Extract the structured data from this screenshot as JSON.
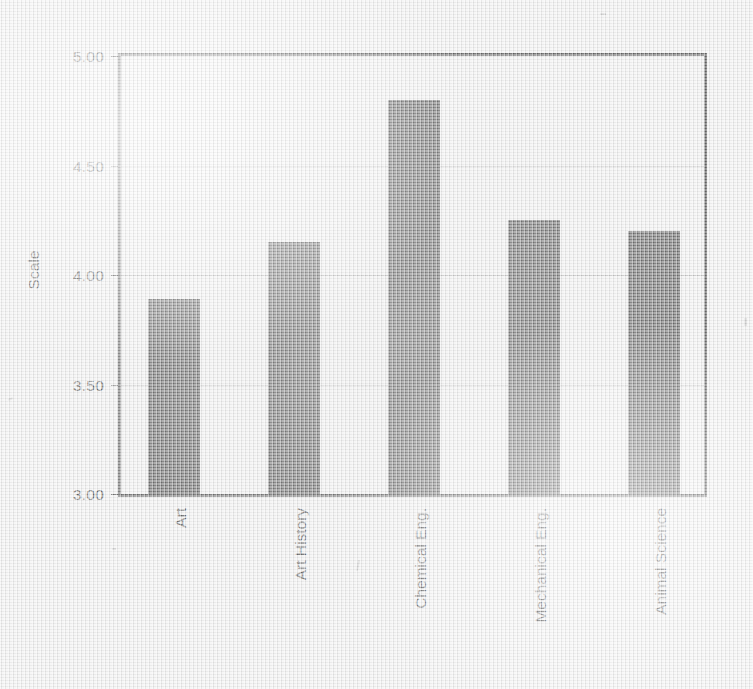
{
  "chart_data": {
    "type": "bar",
    "title": "",
    "subtitle": "",
    "xlabel": "",
    "ylabel": "Scale",
    "categories": [
      "Art",
      "Art History",
      "Chemical Eng.",
      "Mechanical Eng.",
      "Animal Science"
    ],
    "values": [
      3.89,
      4.15,
      4.8,
      4.25,
      4.2
    ],
    "ylim": [
      3.0,
      5.0
    ],
    "ytick_values": [
      5.0,
      4.5,
      4.0,
      3.5,
      3.0
    ],
    "ytick_labels": [
      "5.00",
      "4.50",
      "4.00",
      "3.50",
      "3.00"
    ],
    "grid": true,
    "grid_axis": "y",
    "legend": false,
    "legend_position": "none",
    "annotations": [],
    "series": [
      {
        "name": "Scale",
        "values": [
          3.89,
          4.15,
          4.8,
          4.25,
          4.2
        ]
      }
    ]
  },
  "colors": {
    "bar_fill": "#2e2e2e",
    "axis_line": "#2b2b2b",
    "gridline": "#b4b4b4",
    "text": "#262626",
    "background": "#ebebeb"
  },
  "axis": {
    "y_title": "Scale",
    "y_labels": {
      "t0": "5.00",
      "t1": "4.50",
      "t2": "4.00",
      "t3": "3.50",
      "t4": "3.00"
    }
  },
  "x_labels": {
    "c0": "Art",
    "c1": "Art History",
    "c2": "Chemical Eng.",
    "c3": "Mechanical Eng.",
    "c4": "Animal Science"
  }
}
